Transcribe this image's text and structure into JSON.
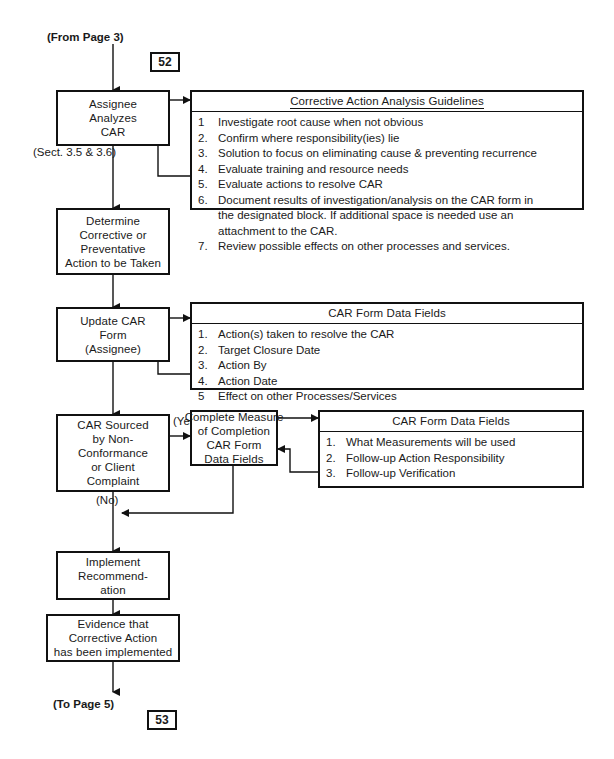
{
  "document": {
    "title": "Corrective Action Request (CAR) Process Flowchart",
    "page_in_marker": "52",
    "page_out_marker": "53",
    "entry_label": "(From Page 3)",
    "exit_label": "(To Page 5)"
  },
  "nodes": {
    "assignee_analyzes": {
      "lines": [
        "Assignee",
        "Analyzes",
        "CAR"
      ],
      "caption": "(Sect. 3.5 & 3.6)"
    },
    "determine_action": {
      "lines": [
        "Determine",
        "Corrective or",
        "Preventative",
        "Action to be Taken"
      ]
    },
    "update_car_form": {
      "lines": [
        "Update CAR",
        "Form",
        "(Assignee)"
      ]
    },
    "car_sourced": {
      "lines": [
        "CAR Sourced",
        "by Non-",
        "Conformance",
        "or Client",
        "Complaint"
      ],
      "yes_label": "(Yes)",
      "no_label": "(No)"
    },
    "complete_measure": {
      "lines": [
        "Complete Measure",
        "of Completion",
        "CAR Form",
        "Data Fields"
      ]
    },
    "implement_recommendation": {
      "lines": [
        "Implement",
        "Recommend-",
        "ation"
      ]
    },
    "evidence_implemented": {
      "lines": [
        "Evidence that",
        "Corrective Action",
        "has been implemented"
      ]
    }
  },
  "panels": {
    "guidelines": {
      "title": "Corrective Action Analysis Guidelines",
      "items": [
        {
          "num": "1",
          "text": "Investigate root cause when not obvious"
        },
        {
          "num": "2.",
          "text": "Confirm where responsibility(ies) lie"
        },
        {
          "num": "3.",
          "text": "Solution to focus on eliminating cause & preventing recurrence"
        },
        {
          "num": "4.",
          "text": "Evaluate training and resource needs"
        },
        {
          "num": "5.",
          "text": "Evaluate actions to resolve CAR"
        },
        {
          "num": "6.",
          "text": "Document results of investigation/analysis on the CAR form in"
        },
        {
          "num": "",
          "text": "the designated block.  If additional space is needed use an"
        },
        {
          "num": "",
          "text": "attachment to the CAR."
        },
        {
          "num": "7.",
          "text": "Review possible effects on other processes and services."
        }
      ]
    },
    "car_form_fields_1": {
      "title": "CAR Form Data Fields",
      "items": [
        {
          "num": "1.",
          "text": "Action(s) taken to resolve the CAR"
        },
        {
          "num": "2.",
          "text": "Target Closure Date"
        },
        {
          "num": "3.",
          "text": "Action By"
        },
        {
          "num": "4.",
          "text": "Action Date"
        },
        {
          "num": "5",
          "text": "Effect on other Processes/Services"
        }
      ]
    },
    "car_form_fields_2": {
      "title": "CAR Form Data Fields",
      "items": [
        {
          "num": "1.",
          "text": "What Measurements will be used"
        },
        {
          "num": "2.",
          "text": "Follow-up Action Responsibility"
        },
        {
          "num": "3.",
          "text": "Follow-up Verification"
        }
      ]
    }
  },
  "colors": {
    "ink": "#111111",
    "paper": "#ffffff"
  }
}
